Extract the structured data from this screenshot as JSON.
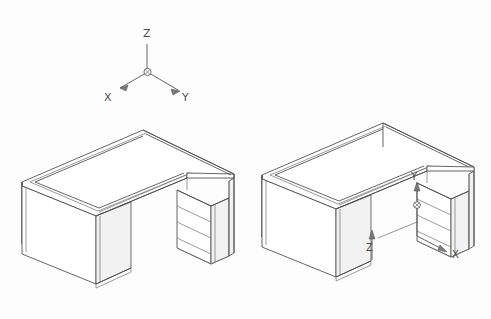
{
  "document": {
    "title": "Axonometric L-shaped desk drawing",
    "background_color": "#fdfdfd",
    "line_color": "#4a4a4a",
    "width": 491,
    "height": 319
  },
  "axis_triad": {
    "name": "world-coordinate-triad",
    "origin_marker": "circled-cross",
    "labels": {
      "z": "Z",
      "x": "X",
      "y": "Y"
    },
    "directions": {
      "z": "up",
      "x": "down-left",
      "y": "down-right"
    }
  },
  "views": [
    {
      "id": "view-left",
      "name": "left-desk-view",
      "object": "L-shaped desk with pedestal drawer unit",
      "has_axis_labels": false,
      "drawer_count": 3,
      "axis_labels": {
        "x": "",
        "y": "",
        "z": ""
      }
    },
    {
      "id": "view-right",
      "name": "right-desk-view",
      "object": "L-shaped desk with pedestal drawer unit",
      "has_axis_labels": true,
      "drawer_count": 3,
      "axis_labels": {
        "x": "X",
        "y": "Y",
        "z": "Z"
      }
    }
  ],
  "annotations": {
    "right_view": {
      "y_label": "Y",
      "x_label": "X",
      "z_label": "Z"
    }
  }
}
